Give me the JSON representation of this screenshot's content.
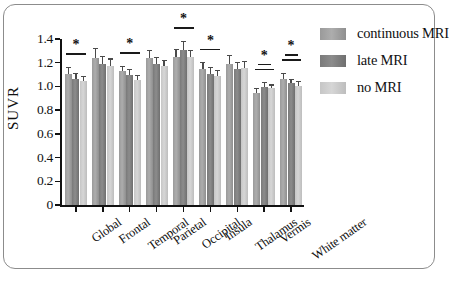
{
  "chart_data": {
    "type": "bar",
    "title": "",
    "xlabel": "",
    "ylabel": "SUVR",
    "ylim": [
      0,
      1.4
    ],
    "yticks": [
      0,
      0.2,
      0.4,
      0.6,
      0.8,
      1.0,
      1.2,
      1.4
    ],
    "ytick_labels": [
      "0",
      "0.2",
      "0.4",
      "0.6",
      "0.8",
      "1.0",
      "1.2",
      "1.4"
    ],
    "grid": false,
    "legend_position": "right",
    "categories": [
      "Global",
      "Frontal",
      "Temporal",
      "Parietal",
      "Occipital",
      "Insula",
      "Thalamus",
      "Vermis",
      "White matter"
    ],
    "series": [
      {
        "name": "continuous MRI",
        "color": "#a0a0a0",
        "values": [
          1.11,
          1.24,
          1.13,
          1.24,
          1.25,
          1.15,
          1.19,
          0.95,
          1.07
        ],
        "errors": [
          0.05,
          0.08,
          0.04,
          0.06,
          0.06,
          0.05,
          0.07,
          0.03,
          0.04
        ]
      },
      {
        "name": "late MRI",
        "color": "#7d7d7d",
        "values": [
          1.07,
          1.19,
          1.1,
          1.19,
          1.31,
          1.11,
          1.15,
          1.0,
          1.03
        ],
        "errors": [
          0.04,
          0.06,
          0.04,
          0.05,
          0.07,
          0.05,
          0.05,
          0.03,
          0.03
        ]
      },
      {
        "name": "no MRI",
        "color": "#cccccc",
        "values": [
          1.05,
          1.18,
          1.06,
          1.18,
          1.25,
          1.09,
          1.16,
          0.99,
          1.01
        ],
        "errors": [
          0.03,
          0.05,
          0.03,
          0.04,
          0.05,
          0.04,
          0.05,
          0.02,
          0.03
        ]
      }
    ],
    "significance_marks": [
      {
        "category": "Global",
        "label": "*",
        "comparisons": 1
      },
      {
        "category": "Temporal",
        "label": "*",
        "comparisons": 1
      },
      {
        "category": "Occipital",
        "label": "*",
        "comparisons": 1
      },
      {
        "category": "Insula",
        "label": "*",
        "comparisons": 1
      },
      {
        "category": "Vermis",
        "label": "*",
        "comparisons": 2
      },
      {
        "category": "White matter",
        "label": "*",
        "comparisons": 2
      }
    ]
  },
  "legend": {
    "items": [
      {
        "label": "continuous MRI"
      },
      {
        "label": "late MRI"
      },
      {
        "label": "no MRI"
      }
    ]
  }
}
